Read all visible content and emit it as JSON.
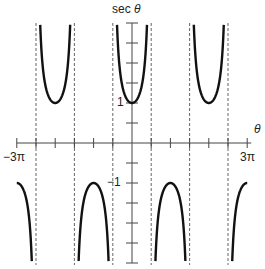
{
  "chart_data": {
    "type": "line",
    "title": "sec θ",
    "function": "sec(θ)",
    "xlabel": "θ",
    "ylabel": "sec θ",
    "xlim": [
      "-3π",
      "3π"
    ],
    "xlim_numeric": [
      -9.4248,
      9.4248
    ],
    "ylim": [
      -3,
      3
    ],
    "x_tick_step": "π/2",
    "y_tick_step": 0.5,
    "labeled_x_ticks": [
      "-3π",
      "3π"
    ],
    "labeled_y_ticks": [
      "1",
      "-1"
    ],
    "asymptotes": [
      "-5π/2",
      "-3π/2",
      "-π/2",
      "π/2",
      "3π/2",
      "5π/2"
    ],
    "asymptotes_numeric": [
      -7.854,
      -4.712,
      -1.5708,
      1.5708,
      4.712,
      7.854
    ],
    "asymptote_style": "dashed",
    "grid": false,
    "legend": null,
    "series": [
      {
        "name": "sec θ",
        "key_points": [
          {
            "x": "-3π",
            "y": -1
          },
          {
            "x": "-2π",
            "y": 1
          },
          {
            "x": "-π",
            "y": -1
          },
          {
            "x": "0",
            "y": 1
          },
          {
            "x": "π",
            "y": -1
          },
          {
            "x": "2π",
            "y": 1
          },
          {
            "x": "3π",
            "y": -1
          }
        ]
      }
    ]
  },
  "labels": {
    "title_text": "sec ",
    "title_symbol": "θ",
    "x_axis": "θ",
    "x_min": "−3π",
    "x_max": "3π",
    "y_one": "1",
    "y_minus_one": "−1"
  },
  "geometry": {
    "origin_x": 132,
    "origin_y": 143,
    "px_per_half_pi": 19.2,
    "px_per_unit_y": 40,
    "line_color": "#111111",
    "axis_color": "#444444",
    "asymptote_color": "#666666"
  }
}
